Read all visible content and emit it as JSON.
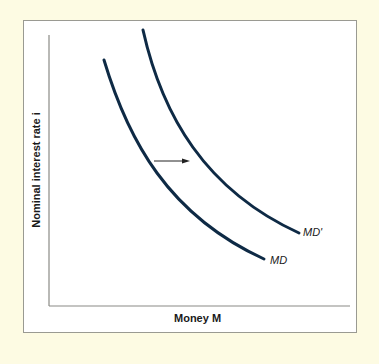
{
  "diagram": {
    "y_axis_label": "Nominal interest rate i",
    "x_axis_label": "Money M",
    "curves": [
      {
        "name": "MD",
        "label": "MD",
        "color": "#0e2a45"
      },
      {
        "name": "MD'",
        "label": "MD'",
        "color": "#0e2a45"
      }
    ],
    "shift_arrow": "rightward shift from MD to MD'",
    "colors": {
      "background": "#fdfbe3",
      "panel": "#ffffff",
      "axis": "#8a8a85",
      "curve": "#0e2a45"
    }
  }
}
